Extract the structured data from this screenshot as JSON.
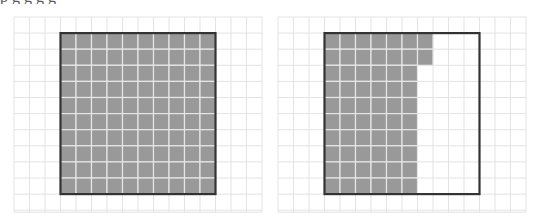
{
  "caption": {
    "text": "p                g   g   g   g"
  },
  "colors": {
    "grid_line": "#e3e3e3",
    "fill": "#999999",
    "fill_line": "#e6e6e6",
    "box_border": "#333333",
    "background": "#ffffff"
  },
  "panels": [
    {
      "name": "left-panel",
      "grid": {
        "x": 14,
        "y": 17,
        "cols": 16,
        "rows": 12,
        "cell_w": 15.5,
        "cell_h": 16.1,
        "extra_h": 0
      },
      "box": {
        "col": 3,
        "row": 1,
        "cols": 10,
        "rows": 10
      },
      "filled_squares": 100,
      "fill_rows": [
        10,
        10,
        10,
        10,
        10,
        10,
        10,
        10,
        10,
        10
      ]
    },
    {
      "name": "right-panel",
      "grid": {
        "x": 278,
        "y": 17,
        "cols": 16,
        "rows": 12,
        "cell_w": 15.5,
        "cell_h": 16.1,
        "extra_h": 0
      },
      "box": {
        "col": 3,
        "row": 1,
        "cols": 10,
        "rows": 10
      },
      "filled_squares": 62,
      "fill_rows": [
        7,
        7,
        6,
        6,
        6,
        6,
        6,
        6,
        6,
        6
      ]
    }
  ]
}
